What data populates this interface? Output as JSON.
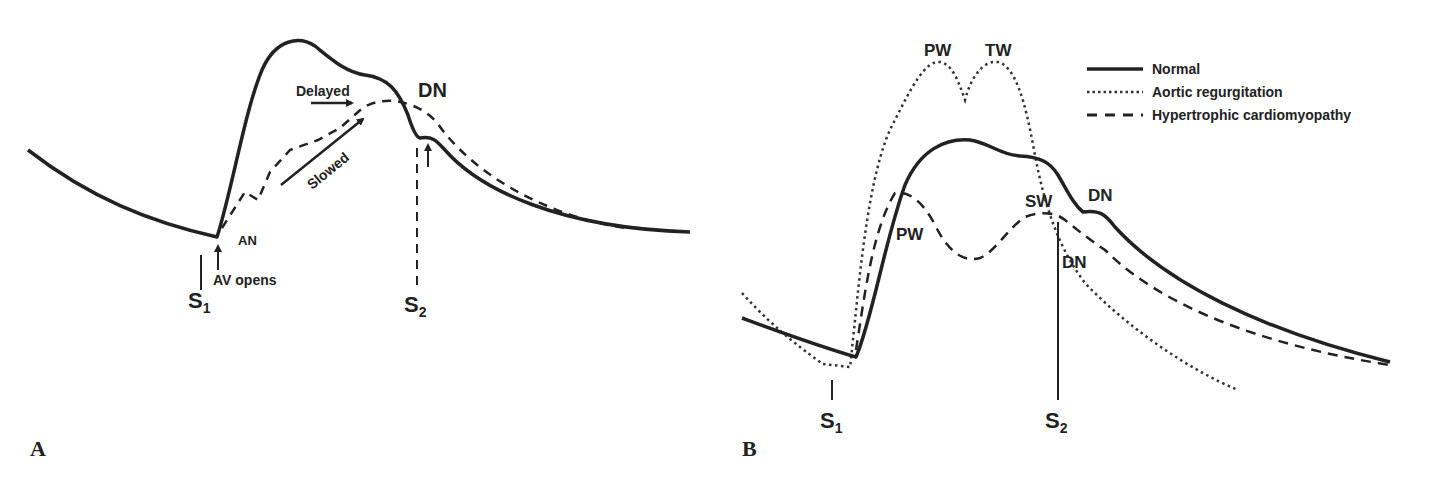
{
  "panel_a": {
    "letter": "A",
    "labels": {
      "dn": "DN",
      "delayed": "Delayed",
      "slowed": "Slowed",
      "an": "AN",
      "av_opens": "AV opens",
      "s1_main": "S",
      "s1_sub": "1",
      "s2_main": "S",
      "s2_sub": "2"
    }
  },
  "panel_b": {
    "letter": "B",
    "labels": {
      "pw_top": "PW",
      "tw": "TW",
      "pw_lower": "PW",
      "sw": "SW",
      "dn_upper": "DN",
      "dn_lower": "DN",
      "s1_main": "S",
      "s1_sub": "1",
      "s2_main": "S",
      "s2_sub": "2"
    },
    "legend": [
      {
        "style": "solid",
        "label": "Normal"
      },
      {
        "style": "dotted",
        "label": "Aortic regurgitation"
      },
      {
        "style": "dashed",
        "label": "Hypertrophic cardiomyopathy"
      }
    ]
  },
  "colors": {
    "ink": "#222222",
    "background": "#ffffff"
  }
}
